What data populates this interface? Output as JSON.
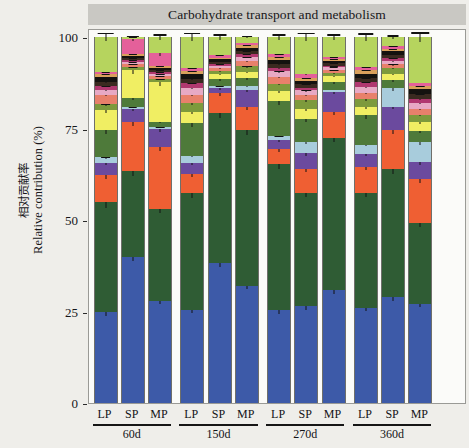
{
  "chart_data": {
    "type": "bar",
    "subtype": "stacked-bar-100-percent",
    "title": "Carbohydrate transport and metabolism",
    "xlabel": "",
    "ylabel_cn": "相对贡献率",
    "ylabel_en": "Relative contribution (%)",
    "ylim": [
      0,
      100
    ],
    "yticks": [
      0,
      25,
      50,
      75,
      100
    ],
    "ytick_labels": [
      "0",
      "25",
      "50",
      "75",
      "100"
    ],
    "grid": false,
    "legend": "none",
    "error_bars": true,
    "categories": [
      "LP",
      "SP",
      "MP",
      "LP",
      "SP",
      "MP",
      "LP",
      "SP",
      "MP",
      "LP",
      "SP",
      "MP"
    ],
    "group_labels": [
      "60d",
      "150d",
      "270d",
      "360d"
    ],
    "group_size": 3,
    "palette": {
      "blue": "#3d5aa8",
      "dark_green": "#2f5c34",
      "orange": "#ef5f33",
      "purple": "#6b4a9e",
      "light_blue": "#a8ccdc",
      "mid_green": "#4e7a3a",
      "yellow": "#f0ee63",
      "olive": "#7d9a3c",
      "pink": "#e4609a",
      "dark_brown": "#3a2a20",
      "light_pink": "#e7a9c4",
      "black_band": "#14120f",
      "tan": "#d9a05b",
      "yellow_green": "#b6d45e",
      "magenta": "#b0386f",
      "lavender": "#b9a7cf",
      "salmon": "#e8806b",
      "cream": "#efe7a8"
    },
    "series": [
      {
        "name": "blue",
        "color": "#3d5aa8",
        "values": [
          24.8,
          39.8,
          28.0,
          25.5,
          38.3,
          32.0,
          25.3,
          26.5,
          31.0,
          26.0,
          29.0,
          27.0
        ],
        "errors": [
          1.8,
          2.2,
          2.0,
          2.0,
          2.4,
          1.8,
          1.8,
          2.0,
          2.2,
          1.8,
          2.0,
          1.9
        ]
      },
      {
        "name": "dark_green",
        "color": "#2f5c34",
        "values": [
          30.0,
          23.5,
          25.0,
          32.0,
          41.0,
          42.5,
          40.0,
          31.0,
          41.5,
          31.5,
          35.0,
          22.0
        ],
        "errors": [
          3.0,
          2.6,
          2.4,
          2.8,
          3.0,
          2.6,
          2.8,
          2.4,
          2.6,
          2.6,
          2.6,
          2.2
        ]
      },
      {
        "name": "orange",
        "color": "#ef5f33",
        "values": [
          7.5,
          13.5,
          17.0,
          5.0,
          5.5,
          6.5,
          4.0,
          6.5,
          7.0,
          7.0,
          10.5,
          12.0
        ],
        "errors": [
          2.0,
          2.4,
          2.4,
          1.6,
          1.6,
          1.8,
          1.4,
          1.8,
          1.8,
          1.8,
          2.0,
          2.2
        ]
      },
      {
        "name": "purple",
        "color": "#6b4a9e",
        "values": [
          3.2,
          3.5,
          4.8,
          3.0,
          1.2,
          4.5,
          2.6,
          4.2,
          5.5,
          3.5,
          6.5,
          4.5
        ],
        "errors": [
          1.2,
          1.2,
          1.4,
          1.2,
          0.8,
          1.3,
          1.0,
          1.2,
          1.4,
          1.2,
          1.5,
          1.3
        ]
      },
      {
        "name": "light_blue",
        "color": "#a8ccdc",
        "values": [
          1.6,
          0.6,
          0.5,
          2.0,
          0.5,
          1.2,
          1.0,
          3.0,
          0.6,
          2.6,
          5.0,
          5.5
        ],
        "errors": [
          0.7,
          0.4,
          0.4,
          0.8,
          0.4,
          0.6,
          0.5,
          1.0,
          0.4,
          0.9,
          1.4,
          1.4
        ]
      },
      {
        "name": "mid_green",
        "color": "#4e7a3a",
        "values": [
          7.5,
          2.5,
          1.5,
          9.0,
          2.0,
          2.0,
          9.5,
          6.5,
          2.0,
          8.0,
          2.2,
          3.0
        ],
        "errors": [
          2.0,
          1.0,
          0.8,
          2.2,
          0.9,
          0.9,
          2.2,
          1.8,
          0.9,
          2.0,
          0.9,
          1.1
        ]
      },
      {
        "name": "yellow",
        "color": "#f0ee63",
        "values": [
          5.5,
          7.5,
          11.0,
          3.0,
          1.5,
          1.8,
          2.8,
          2.5,
          1.8,
          2.2,
          1.8,
          2.5
        ],
        "errors": [
          1.6,
          1.9,
          2.2,
          1.1,
          0.8,
          0.9,
          1.0,
          1.0,
          0.9,
          0.9,
          0.9,
          1.0
        ]
      },
      {
        "name": "olive",
        "color": "#7d9a3c",
        "values": [
          1.5,
          0.8,
          0.7,
          2.5,
          0.8,
          1.5,
          2.0,
          2.5,
          0.8,
          2.2,
          1.5,
          2.0
        ],
        "errors": [
          0.7,
          0.5,
          0.4,
          1.0,
          0.5,
          0.7,
          0.8,
          1.0,
          0.5,
          0.9,
          0.7,
          0.9
        ]
      },
      {
        "name": "salmon",
        "color": "#e8806b",
        "values": [
          2.6,
          0.8,
          0.8,
          2.2,
          0.8,
          1.5,
          2.0,
          1.5,
          0.8,
          1.8,
          1.0,
          1.5
        ],
        "errors": [
          0.9,
          0.5,
          0.5,
          0.9,
          0.5,
          0.7,
          0.8,
          0.7,
          0.5,
          0.8,
          0.6,
          0.7
        ]
      },
      {
        "name": "light_pink",
        "color": "#e7a9c4",
        "values": [
          1.4,
          0.6,
          0.6,
          2.0,
          0.6,
          1.0,
          1.4,
          1.2,
          0.7,
          1.6,
          1.0,
          1.6
        ],
        "errors": [
          0.6,
          0.4,
          0.4,
          0.8,
          0.4,
          0.5,
          0.6,
          0.6,
          0.4,
          0.7,
          0.5,
          0.7
        ]
      },
      {
        "name": "magenta",
        "color": "#b0386f",
        "values": [
          1.0,
          0.5,
          0.5,
          1.2,
          0.5,
          0.8,
          1.0,
          0.8,
          0.5,
          1.2,
          0.8,
          1.2
        ],
        "errors": [
          0.5,
          0.3,
          0.3,
          0.5,
          0.3,
          0.4,
          0.5,
          0.4,
          0.3,
          0.5,
          0.4,
          0.5
        ]
      },
      {
        "name": "dark_brown",
        "color": "#3a2a20",
        "values": [
          1.2,
          0.6,
          0.6,
          1.2,
          0.6,
          0.9,
          1.1,
          0.9,
          0.6,
          1.2,
          0.9,
          1.3
        ],
        "errors": [
          0.5,
          0.3,
          0.3,
          0.5,
          0.3,
          0.4,
          0.5,
          0.4,
          0.3,
          0.5,
          0.4,
          0.5
        ]
      },
      {
        "name": "black_band",
        "color": "#14120f",
        "values": [
          1.2,
          0.6,
          0.6,
          1.2,
          0.6,
          0.9,
          1.1,
          0.9,
          0.6,
          1.2,
          0.9,
          1.3
        ],
        "errors": [
          0.5,
          0.3,
          0.3,
          0.5,
          0.3,
          0.4,
          0.5,
          0.4,
          0.3,
          0.5,
          0.4,
          0.5
        ]
      },
      {
        "name": "tan",
        "color": "#d9a05b",
        "values": [
          0.8,
          0.5,
          0.5,
          0.9,
          0.5,
          0.7,
          0.8,
          0.7,
          0.5,
          0.9,
          0.7,
          0.9
        ],
        "errors": [
          0.4,
          0.3,
          0.3,
          0.4,
          0.3,
          0.3,
          0.4,
          0.3,
          0.3,
          0.4,
          0.3,
          0.4
        ]
      },
      {
        "name": "pink",
        "color": "#e4609a",
        "values": [
          0.7,
          4.2,
          3.4,
          0.8,
          0.7,
          0.7,
          0.8,
          1.2,
          0.6,
          0.9,
          0.7,
          0.9
        ],
        "errors": [
          0.4,
          1.3,
          1.2,
          0.4,
          0.4,
          0.4,
          0.4,
          0.6,
          0.3,
          0.4,
          0.4,
          0.4
        ]
      },
      {
        "name": "yellow_green",
        "color": "#b6d45e",
        "values": [
          9.5,
          0.5,
          4.5,
          8.5,
          4.9,
          1.5,
          4.6,
          10.1,
          5.5,
          8.2,
          2.5,
          12.4
        ],
        "errors": [
          2.4,
          0.3,
          1.5,
          2.2,
          1.5,
          0.7,
          1.5,
          2.4,
          1.6,
          2.1,
          1.0,
          2.6
        ]
      }
    ]
  }
}
